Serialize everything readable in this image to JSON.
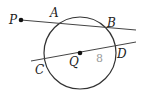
{
  "diagram": {
    "type": "geometry",
    "circle": {
      "center_label": "Q",
      "cx": 80,
      "cy": 53,
      "r": 36
    },
    "points": {
      "P": {
        "label": "P",
        "x": 21,
        "y": 20,
        "lx": 9,
        "ly": 24
      },
      "A": {
        "label": "A",
        "lx": 50,
        "ly": 17
      },
      "B": {
        "label": "B",
        "lx": 107,
        "ly": 27
      },
      "C": {
        "label": "C",
        "lx": 35,
        "ly": 74
      },
      "D": {
        "label": "D",
        "lx": 117,
        "ly": 58
      },
      "Q": {
        "label": "Q",
        "x": 80,
        "y": 53,
        "lx": 69,
        "ly": 66
      }
    },
    "secant_PB": {
      "x1": 21,
      "y1": 20,
      "x2": 136,
      "y2": 30
    },
    "line_CD": {
      "x1": 31,
      "y1": 61,
      "x2": 136,
      "y2": 42
    },
    "radius_label": {
      "text": "8",
      "x": 96,
      "y": 62
    },
    "colors": {
      "stroke": "#333333",
      "label": "#222222",
      "measure": "#9a9a9a"
    }
  }
}
